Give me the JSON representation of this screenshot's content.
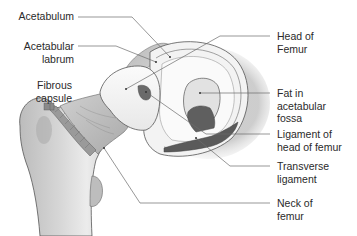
{
  "diagram": {
    "colors": {
      "background": "#ffffff",
      "bone_light": "#f4f4f4",
      "bone_mid": "#c8c8c8",
      "bone_dark": "#9a9a9a",
      "ligament": "#5e5e5e",
      "outline": "#555555",
      "leader_line": "#666666",
      "text": "#2a2a2a"
    },
    "labels": {
      "left": [
        {
          "id": "acetabulum",
          "lines": [
            "Acetabulum"
          ]
        },
        {
          "id": "acetabular-labrum",
          "lines": [
            "Acetabular",
            "labrum"
          ]
        },
        {
          "id": "fibrous-capsule",
          "lines": [
            "Fibrous",
            "capsule"
          ]
        }
      ],
      "right": [
        {
          "id": "head-of-femur",
          "lines": [
            "Head of",
            "Femur"
          ]
        },
        {
          "id": "fat-in-acetabular-fossa",
          "lines": [
            "Fat in",
            "acetabular",
            "fossa"
          ]
        },
        {
          "id": "ligament-of-head-of-femur",
          "lines": [
            "Ligament of",
            "head of femur"
          ]
        },
        {
          "id": "transverse-ligament",
          "lines": [
            "Transverse",
            "ligament"
          ]
        },
        {
          "id": "neck-of-femur",
          "lines": [
            "Neck of",
            "femur"
          ]
        }
      ]
    }
  }
}
